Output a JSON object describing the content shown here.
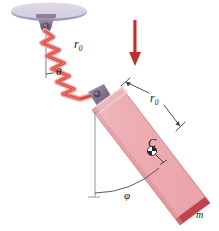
{
  "figure": {
    "type": "mechanics-diagram",
    "background_color": "#ffffff",
    "labels": {
      "spring_length": "r",
      "spring_length_sub": "0",
      "spring_angle": "θ",
      "bar_length": "r",
      "bar_length_sub": "0",
      "center_of_mass": "C",
      "bar_angle": "φ",
      "mass": "m"
    },
    "colors": {
      "spring": "#d9443a",
      "bar_fill": "#eaa6ab",
      "bar_highlight": "#f6d2d5",
      "bar_edge": "#c0434a",
      "ceiling": "#b9aec9",
      "mount": "#8d8099",
      "gravity_arrow": "#c0302b",
      "construction_line": "#7a7a7a",
      "label_text": "#1a1a1a"
    },
    "elements": {
      "ceiling": "ceiling-ellipse",
      "mount": "ceiling-mount-bracket",
      "spring": "coil-spring",
      "pivot": "pivot-joint",
      "bar": "rigid-bar",
      "com_marker": "center-of-mass-symbol",
      "gravity_arrow": "gravity-direction-arrow",
      "theta_arc": "theta-angle-arc",
      "phi_arc": "phi-angle-arc",
      "vertical_top": "vertical-reference-line-top",
      "vertical_bottom": "vertical-reference-line-bottom",
      "dimension": "bar-length-dimension-line"
    }
  }
}
